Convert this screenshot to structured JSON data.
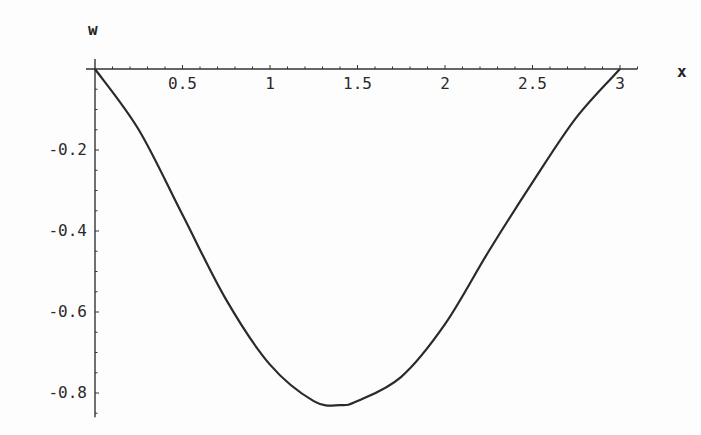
{
  "chart_data": {
    "type": "line",
    "title": "",
    "xlabel": "x",
    "ylabel": "w",
    "xlim": [
      0,
      3.05
    ],
    "ylim": [
      -0.86,
      0
    ],
    "x_ticks": [
      0.5,
      1,
      1.5,
      2,
      2.5,
      3
    ],
    "x_tick_labels": [
      "0.5",
      "1",
      "1.5",
      "2",
      "2.5",
      "3"
    ],
    "y_ticks": [
      -0.2,
      -0.4,
      -0.6,
      -0.8
    ],
    "y_tick_labels": [
      "-0.2",
      "-0.4",
      "-0.6",
      "-0.8"
    ],
    "grid": false,
    "legend": null,
    "series": [
      {
        "name": "w(x)",
        "x": [
          0,
          0.25,
          0.5,
          0.75,
          1.0,
          1.25,
          1.4,
          1.5,
          1.75,
          2.0,
          2.25,
          2.5,
          2.75,
          3.0
        ],
        "values": [
          0,
          -0.15,
          -0.36,
          -0.57,
          -0.73,
          -0.82,
          -0.83,
          -0.82,
          -0.76,
          -0.63,
          -0.45,
          -0.28,
          -0.12,
          0
        ]
      }
    ]
  }
}
